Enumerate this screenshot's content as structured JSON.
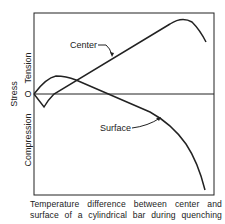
{
  "diagram": {
    "y_axis": {
      "title": "Stress",
      "positive_label": "Tension",
      "negative_label": "Compression",
      "zero_label": "O"
    },
    "curves": [
      {
        "name": "center",
        "label": "Center"
      },
      {
        "name": "surface",
        "label": "Surface"
      }
    ],
    "caption": {
      "line1": "Temperature difference between center and",
      "line2": "surface of a cylindrical bar during quenching"
    },
    "colors": {
      "line": "#222222",
      "background": "#ffffff"
    }
  }
}
